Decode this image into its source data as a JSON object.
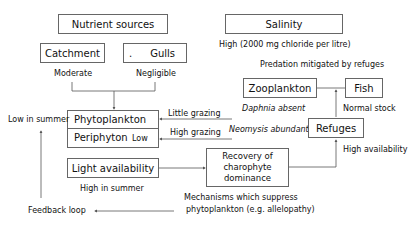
{
  "nodes": {
    "nutrient_sources": "Nutrient sources",
    "catchment": "Catchment",
    "gulls": "Gulls",
    "gulls_dot": ".",
    "salinity": "Salinity",
    "zooplankton": "Zooplankton",
    "fish": "Fish",
    "phytoplankton": "Phytoplankton",
    "periphyton": "Periphyton",
    "periphyton_level": "Low",
    "light_availability": "Light availability",
    "refuges": "Refuges",
    "recovery": [
      "Recovery of",
      "charophyte",
      "dominance"
    ]
  },
  "labels": {
    "catchment_level": "Moderate",
    "gulls_level": "Negligible",
    "salinity_level": "High (2000 mg chloride per litre)",
    "predation": "Predation mitigated by refuges",
    "fish_stock": "Normal stock",
    "daphnia": "Daphnia absent",
    "neomysis": "Neomysis abundant",
    "little_grazing": "Little grazing",
    "high_grazing": "High grazing",
    "phyto_low": "Low in summer",
    "light_high": "High in summer",
    "refuges_avail": "High availability",
    "mechanisms_line1": "Mechanisms which  suppress",
    "mechanisms_line2": "phytoplankton (e.g. allelopathy)",
    "feedback": "Feedback loop"
  },
  "colors": {
    "line": "#555555",
    "border": "#666666",
    "text": "#111111"
  }
}
